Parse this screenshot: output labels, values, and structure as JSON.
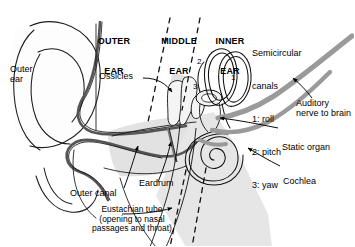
{
  "figure": {
    "sections": [
      {
        "id": "outer",
        "line1": "OUTER",
        "line2": "EAR"
      },
      {
        "id": "middle",
        "line1": "MIDDLE",
        "line2": "EAR"
      },
      {
        "id": "inner",
        "line1": "INNER",
        "line2": "EAR"
      }
    ],
    "labels": {
      "outer_ear": "Outer\near",
      "ossicles": "Ossicles",
      "outer_canal": "Outer canal",
      "eardrum": "Eardrum",
      "eustachian": "Eustachian tube\n(opening to nasal\npassages and throat)",
      "auditory_nerve": "Auditory\nnerve to brain",
      "static_organ": "Static organ",
      "cochlea": "Cochlea"
    },
    "legend": {
      "title_line1": "Semicircular",
      "title_line2": "canals",
      "items": [
        {
          "num": "1",
          "text": "1: roll"
        },
        {
          "num": "2",
          "text": "2: pitch"
        },
        {
          "num": "3",
          "text": "3: yaw"
        }
      ]
    },
    "canal_numbers": [
      {
        "id": "canal-1",
        "value": "1"
      },
      {
        "id": "canal-2",
        "value": "2"
      },
      {
        "id": "canal-3",
        "value": "3"
      }
    ],
    "colors": {
      "ink": "#000000",
      "outline": "#1a1a1a",
      "tissue_fill": "#e2e2e2",
      "canal_fill": "#dedede",
      "nerve_gray": "#9a9a9a",
      "membrane_gray": "#8d8d8d",
      "background": "#ffffff"
    }
  }
}
